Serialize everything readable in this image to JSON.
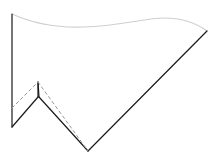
{
  "figure": {
    "title": "Line drawing of a folded flag-like polygon with dashed fold reference",
    "width": 219,
    "height": 165,
    "background_color": "#ffffff",
    "colors": {
      "dark_stroke": "#1a1a1a",
      "light_curve": "#cfcfcf",
      "dashed_stroke": "#9a9a9a"
    },
    "stroke_widths": {
      "dark": 1.2,
      "light": 1.1,
      "dashed": 1.0
    },
    "dash_pattern": "3 3"
  },
  "chart_data": {
    "type": "line",
    "title": "Line drawing of a folded flag-like polygon with dashed fold reference",
    "xlabel": "",
    "ylabel": "",
    "xlim": [
      0,
      219
    ],
    "ylim": [
      0,
      165
    ],
    "grid": false,
    "legend": "none",
    "series": [
      {
        "name": "top-curve",
        "style": "solid",
        "color": "#cfcfcf",
        "path": "M 12 14 C 34 24, 56 28, 84 27 C 118 26, 146 18, 164 18 C 182 18, 196 23, 207 31"
      },
      {
        "name": "left-vertical-edge",
        "style": "solid",
        "color": "#1a1a1a",
        "path": "M 12 14 L 12 127"
      },
      {
        "name": "zigzag-left-ascent",
        "style": "solid",
        "color": "#1a1a1a",
        "path": "M 12 127 L 38 97"
      },
      {
        "name": "spike-up",
        "style": "solid",
        "color": "#1a1a1a",
        "path": "M 38 97 L 38 82"
      },
      {
        "name": "spike-down",
        "style": "solid",
        "color": "#1a1a1a",
        "path": "M 38 82 L 39 97"
      },
      {
        "name": "zigzag-right-descent",
        "style": "solid",
        "color": "#1a1a1a",
        "path": "M 39 97 L 88 151"
      },
      {
        "name": "long-diagonal-to-tip",
        "style": "solid",
        "color": "#1a1a1a",
        "path": "M 88 151 L 207 31"
      },
      {
        "name": "dashed-fold-left",
        "style": "dashed",
        "color": "#9a9a9a",
        "path": "M 12 108 L 38 82"
      },
      {
        "name": "dashed-fold-right",
        "style": "dashed",
        "color": "#9a9a9a",
        "path": "M 38 82 L 88 151"
      }
    ],
    "vertices": [
      {
        "name": "top-left",
        "x": 12,
        "y": 14
      },
      {
        "name": "curve-dip",
        "x": 84,
        "y": 27
      },
      {
        "name": "curve-crest",
        "x": 164,
        "y": 18
      },
      {
        "name": "right-tip",
        "x": 207,
        "y": 31
      },
      {
        "name": "left-bottom-notch",
        "x": 12,
        "y": 127
      },
      {
        "name": "spike-base",
        "x": 38,
        "y": 97
      },
      {
        "name": "spike-tip",
        "x": 38,
        "y": 82
      },
      {
        "name": "bottom-vertex",
        "x": 88,
        "y": 151
      },
      {
        "name": "dashed-left-anchor",
        "x": 12,
        "y": 108
      }
    ]
  }
}
